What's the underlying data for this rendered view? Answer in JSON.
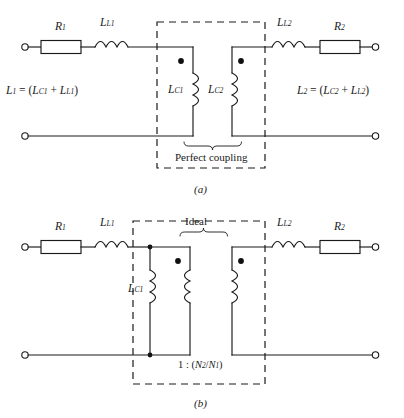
{
  "figure": {
    "title_a": "(a)",
    "title_b": "(b)",
    "panel_a": {
      "caption": "(a)",
      "components": {
        "r1": "R",
        "r1_sub": "1",
        "ll1": "L",
        "ll1_sub": "L1",
        "ll2": "L",
        "ll2_sub": "L2",
        "r2": "R",
        "r2_sub": "2",
        "lc1": "L",
        "lc1_sub": "C1",
        "lc2": "L",
        "lc2_sub": "C2"
      },
      "equation_left": {
        "lhs": "L",
        "lhs_sub": "1",
        "eq": " = (",
        "t1": "L",
        "t1_sub": "C1",
        "plus": " + ",
        "t2": "L",
        "t2_sub": "L1",
        "close": ")"
      },
      "equation_right": {
        "lhs": "L",
        "lhs_sub": "2",
        "eq": " = (",
        "t1": "L",
        "t1_sub": "C2",
        "plus": " + ",
        "t2": "L",
        "t2_sub": "L2",
        "close": ")"
      },
      "annotation": "Perfect coupling"
    },
    "panel_b": {
      "caption": "(b)",
      "components": {
        "r1": "R",
        "r1_sub": "1",
        "ll1": "L",
        "ll1_sub": "L1",
        "ll2": "L",
        "ll2_sub": "L2",
        "r2": "R",
        "r2_sub": "2",
        "lc1": "L",
        "lc1_sub": "C1"
      },
      "annotation": "Ideal",
      "turns_ratio": {
        "left": "1",
        "colon": " : (",
        "n2": "N",
        "n2_sub": "2",
        "slash": "/",
        "n1": "N",
        "n1_sub": "1",
        "close": ")"
      }
    },
    "colors": {
      "ink": "#1a1a1a",
      "paper": "#ffffff"
    }
  }
}
